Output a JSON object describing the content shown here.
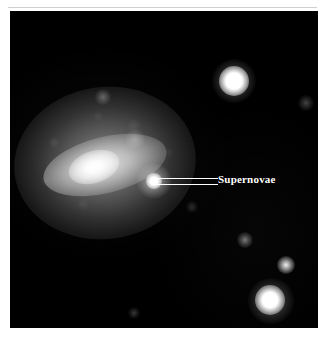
{
  "figure": {
    "kind": "astronomical-photograph",
    "frame_background_color": "#ffffff",
    "sky_background_color": "#000000"
  },
  "annotation": {
    "label": "Supernovae",
    "label_color": "#ffffff",
    "leader_line_color": "#ffffff",
    "leader_line_count": 2
  },
  "objects": {
    "galaxy": {
      "name": "galaxy-halo",
      "core_name": "galaxy-core"
    },
    "supernova": {
      "name": "supernova-core"
    },
    "stars": [
      {
        "name": "star-upper-right"
      },
      {
        "name": "star-lower-right"
      },
      {
        "name": "star-right-small"
      },
      {
        "name": "star-faint-mid"
      },
      {
        "name": "star-faint-edge"
      },
      {
        "name": "star-faint-bottom"
      }
    ]
  }
}
